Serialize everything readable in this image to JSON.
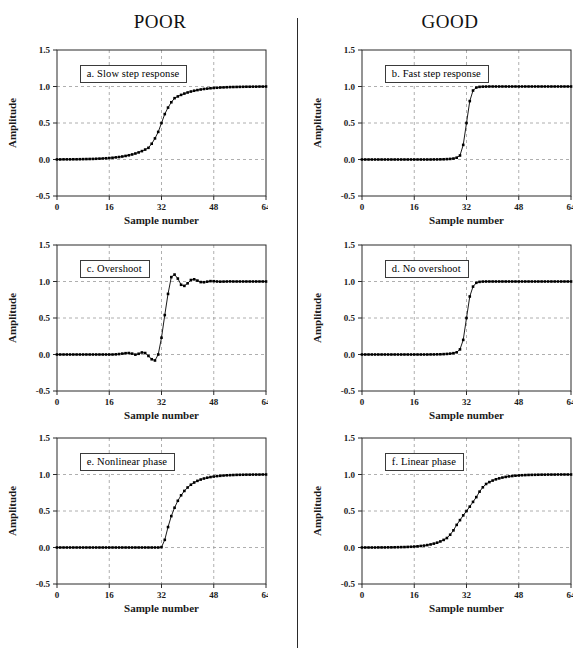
{
  "headings": {
    "left": "POOR",
    "right": "GOOD"
  },
  "axes": {
    "xlabel": "Sample number",
    "ylabel": "Amplitude",
    "xticks": [
      0,
      16,
      32,
      48,
      64
    ],
    "xtick_labels": [
      "0",
      "16",
      "32",
      "48",
      "64"
    ],
    "yticks": [
      -0.5,
      0.0,
      0.5,
      1.0,
      1.5
    ],
    "ytick_labels": [
      "-0.5",
      "0.0",
      "0.5",
      "1.0",
      "1.5"
    ],
    "xlim": [
      0,
      64
    ],
    "ylim": [
      -0.5,
      1.5
    ],
    "grid": true
  },
  "colors": {
    "ink": "#000000",
    "axis": "#2b2b2b",
    "grid": "#9a9a9a",
    "background": "#ffffff"
  },
  "chart_data": [
    {
      "id": "a",
      "type": "line",
      "column": "POOR",
      "title": "a.  Slow step response",
      "xlabel": "Sample number",
      "ylabel": "Amplitude",
      "xlim": [
        0,
        64
      ],
      "ylim": [
        -0.5,
        1.5
      ],
      "grid": true,
      "x": [
        0,
        1,
        2,
        3,
        4,
        5,
        6,
        7,
        8,
        9,
        10,
        11,
        12,
        13,
        14,
        15,
        16,
        17,
        18,
        19,
        20,
        21,
        22,
        23,
        24,
        25,
        26,
        27,
        28,
        29,
        30,
        31,
        32,
        33,
        34,
        35,
        36,
        37,
        38,
        39,
        40,
        41,
        42,
        43,
        44,
        45,
        46,
        47,
        48,
        49,
        50,
        51,
        52,
        53,
        54,
        55,
        56,
        57,
        58,
        59,
        60,
        61,
        62,
        63,
        64
      ],
      "values": [
        0.001,
        0.001,
        0.002,
        0.002,
        0.002,
        0.003,
        0.003,
        0.004,
        0.005,
        0.006,
        0.007,
        0.008,
        0.01,
        0.012,
        0.014,
        0.017,
        0.02,
        0.024,
        0.029,
        0.034,
        0.041,
        0.049,
        0.058,
        0.069,
        0.082,
        0.097,
        0.115,
        0.136,
        0.16,
        0.216,
        0.289,
        0.378,
        0.5,
        0.622,
        0.711,
        0.784,
        0.84,
        0.864,
        0.885,
        0.903,
        0.918,
        0.931,
        0.942,
        0.951,
        0.959,
        0.966,
        0.971,
        0.976,
        0.98,
        0.983,
        0.986,
        0.988,
        0.99,
        0.992,
        0.993,
        0.994,
        0.995,
        0.996,
        0.997,
        0.997,
        0.998,
        0.998,
        0.999,
        0.999,
        1.0
      ]
    },
    {
      "id": "b",
      "type": "line",
      "column": "GOOD",
      "title": "b.  Fast step response",
      "xlabel": "Sample number",
      "ylabel": "Amplitude",
      "xlim": [
        0,
        64
      ],
      "ylim": [
        -0.5,
        1.5
      ],
      "grid": true,
      "x": [
        0,
        1,
        2,
        3,
        4,
        5,
        6,
        7,
        8,
        9,
        10,
        11,
        12,
        13,
        14,
        15,
        16,
        17,
        18,
        19,
        20,
        21,
        22,
        23,
        24,
        25,
        26,
        27,
        28,
        29,
        30,
        31,
        32,
        33,
        34,
        35,
        36,
        37,
        38,
        39,
        40,
        41,
        42,
        43,
        44,
        45,
        46,
        47,
        48,
        49,
        50,
        51,
        52,
        53,
        54,
        55,
        56,
        57,
        58,
        59,
        60,
        61,
        62,
        63,
        64
      ],
      "values": [
        0.0,
        0.0,
        0.0,
        0.0,
        0.0,
        0.0,
        0.0,
        0.0,
        0.0,
        0.0,
        0.0,
        0.0,
        0.0,
        0.0,
        0.0,
        0.0,
        0.0,
        0.0,
        0.0,
        0.0,
        0.0,
        0.0,
        0.001,
        0.001,
        0.002,
        0.003,
        0.005,
        0.008,
        0.013,
        0.025,
        0.055,
        0.2,
        0.5,
        0.8,
        0.945,
        0.985,
        0.995,
        0.998,
        0.999,
        1.0,
        1.0,
        1.0,
        1.0,
        1.0,
        1.0,
        1.0,
        1.0,
        1.0,
        1.0,
        1.0,
        1.0,
        1.0,
        1.0,
        1.0,
        1.0,
        1.0,
        1.0,
        1.0,
        1.0,
        1.0,
        1.0,
        1.0,
        1.0,
        1.0,
        1.0
      ]
    },
    {
      "id": "c",
      "type": "line",
      "column": "POOR",
      "title": "c.  Overshoot",
      "xlabel": "Sample number",
      "ylabel": "Amplitude",
      "xlim": [
        0,
        64
      ],
      "ylim": [
        -0.5,
        1.5
      ],
      "grid": true,
      "x": [
        0,
        1,
        2,
        3,
        4,
        5,
        6,
        7,
        8,
        9,
        10,
        11,
        12,
        13,
        14,
        15,
        16,
        17,
        18,
        19,
        20,
        21,
        22,
        23,
        24,
        25,
        26,
        27,
        28,
        29,
        30,
        31,
        32,
        33,
        34,
        35,
        36,
        37,
        38,
        39,
        40,
        41,
        42,
        43,
        44,
        45,
        46,
        47,
        48,
        49,
        50,
        51,
        52,
        53,
        54,
        55,
        56,
        57,
        58,
        59,
        60,
        61,
        62,
        63,
        64
      ],
      "values": [
        0.0,
        0.0,
        0.0,
        0.0,
        0.0,
        0.0,
        0.0,
        0.0,
        0.0,
        0.0,
        0.0,
        0.0,
        0.0,
        0.0,
        0.0,
        0.0,
        0.0,
        0.0,
        0.002,
        0.006,
        0.012,
        0.018,
        0.02,
        0.012,
        -0.002,
        0.01,
        0.028,
        0.02,
        -0.02,
        -0.065,
        -0.082,
        0.0,
        0.23,
        0.54,
        0.83,
        1.06,
        1.095,
        1.04,
        0.955,
        0.94,
        0.975,
        1.02,
        1.03,
        1.012,
        0.992,
        0.99,
        0.998,
        1.005,
        1.004,
        1.0,
        0.998,
        0.999,
        1.0,
        1.001,
        1.0,
        1.0,
        1.0,
        1.0,
        1.0,
        1.0,
        1.0,
        1.0,
        1.0,
        1.0,
        1.0
      ]
    },
    {
      "id": "d",
      "type": "line",
      "column": "GOOD",
      "title": "d.  No overshoot",
      "xlabel": "Sample number",
      "ylabel": "Amplitude",
      "xlim": [
        0,
        64
      ],
      "ylim": [
        -0.5,
        1.5
      ],
      "grid": true,
      "x": [
        0,
        1,
        2,
        3,
        4,
        5,
        6,
        7,
        8,
        9,
        10,
        11,
        12,
        13,
        14,
        15,
        16,
        17,
        18,
        19,
        20,
        21,
        22,
        23,
        24,
        25,
        26,
        27,
        28,
        29,
        30,
        31,
        32,
        33,
        34,
        35,
        36,
        37,
        38,
        39,
        40,
        41,
        42,
        43,
        44,
        45,
        46,
        47,
        48,
        49,
        50,
        51,
        52,
        53,
        54,
        55,
        56,
        57,
        58,
        59,
        60,
        61,
        62,
        63,
        64
      ],
      "values": [
        0.0,
        0.0,
        0.0,
        0.0,
        0.0,
        0.0,
        0.0,
        0.0,
        0.0,
        0.0,
        0.0,
        0.0,
        0.0,
        0.0,
        0.0,
        0.0,
        0.0,
        0.0,
        0.0,
        0.0,
        0.0,
        0.001,
        0.001,
        0.002,
        0.003,
        0.005,
        0.008,
        0.012,
        0.018,
        0.03,
        0.07,
        0.2,
        0.5,
        0.795,
        0.93,
        0.982,
        0.995,
        0.999,
        1.0,
        1.0,
        1.0,
        1.0,
        1.0,
        1.0,
        1.0,
        1.0,
        1.0,
        1.0,
        1.0,
        1.0,
        1.0,
        1.0,
        1.0,
        1.0,
        1.0,
        1.0,
        1.0,
        1.0,
        1.0,
        1.0,
        1.0,
        1.0,
        1.0,
        1.0,
        1.0
      ]
    },
    {
      "id": "e",
      "type": "line",
      "column": "POOR",
      "title": "e.  Nonlinear phase",
      "xlabel": "Sample number",
      "ylabel": "Amplitude",
      "xlim": [
        0,
        64
      ],
      "ylim": [
        -0.5,
        1.5
      ],
      "grid": true,
      "x": [
        0,
        1,
        2,
        3,
        4,
        5,
        6,
        7,
        8,
        9,
        10,
        11,
        12,
        13,
        14,
        15,
        16,
        17,
        18,
        19,
        20,
        21,
        22,
        23,
        24,
        25,
        26,
        27,
        28,
        29,
        30,
        31,
        32,
        33,
        34,
        35,
        36,
        37,
        38,
        39,
        40,
        41,
        42,
        43,
        44,
        45,
        46,
        47,
        48,
        49,
        50,
        51,
        52,
        53,
        54,
        55,
        56,
        57,
        58,
        59,
        60,
        61,
        62,
        63,
        64
      ],
      "values": [
        0.0,
        0.0,
        0.0,
        0.0,
        0.0,
        0.0,
        0.0,
        0.0,
        0.0,
        0.0,
        0.0,
        0.0,
        0.0,
        0.0,
        0.0,
        0.0,
        0.0,
        0.0,
        0.0,
        0.0,
        0.0,
        0.0,
        0.0,
        0.0,
        0.0,
        0.0,
        0.0,
        0.0,
        0.0,
        0.0,
        0.0,
        0.0,
        0.005,
        0.105,
        0.28,
        0.43,
        0.545,
        0.64,
        0.715,
        0.775,
        0.822,
        0.86,
        0.89,
        0.913,
        0.931,
        0.945,
        0.956,
        0.965,
        0.972,
        0.978,
        0.982,
        0.986,
        0.989,
        0.991,
        0.993,
        0.995,
        0.996,
        0.997,
        0.998,
        0.998,
        0.999,
        0.999,
        0.999,
        1.0,
        1.0
      ]
    },
    {
      "id": "f",
      "type": "line",
      "column": "GOOD",
      "title": "f.  Linear phase",
      "xlabel": "Sample number",
      "ylabel": "Amplitude",
      "xlim": [
        0,
        64
      ],
      "ylim": [
        -0.5,
        1.5
      ],
      "grid": true,
      "x": [
        0,
        1,
        2,
        3,
        4,
        5,
        6,
        7,
        8,
        9,
        10,
        11,
        12,
        13,
        14,
        15,
        16,
        17,
        18,
        19,
        20,
        21,
        22,
        23,
        24,
        25,
        26,
        27,
        28,
        29,
        30,
        31,
        32,
        33,
        34,
        35,
        36,
        37,
        38,
        39,
        40,
        41,
        42,
        43,
        44,
        45,
        46,
        47,
        48,
        49,
        50,
        51,
        52,
        53,
        54,
        55,
        56,
        57,
        58,
        59,
        60,
        61,
        62,
        63,
        64
      ],
      "values": [
        0.0,
        0.0,
        0.0,
        0.0,
        0.0,
        0.001,
        0.001,
        0.001,
        0.002,
        0.002,
        0.003,
        0.004,
        0.005,
        0.006,
        0.008,
        0.01,
        0.013,
        0.016,
        0.021,
        0.026,
        0.033,
        0.042,
        0.053,
        0.066,
        0.083,
        0.104,
        0.13,
        0.175,
        0.235,
        0.31,
        0.375,
        0.44,
        0.5,
        0.56,
        0.625,
        0.69,
        0.765,
        0.825,
        0.87,
        0.896,
        0.917,
        0.934,
        0.947,
        0.958,
        0.967,
        0.974,
        0.979,
        0.984,
        0.987,
        0.99,
        0.992,
        0.994,
        0.995,
        0.996,
        0.997,
        0.998,
        0.998,
        0.999,
        0.999,
        0.999,
        1.0,
        1.0,
        1.0,
        1.0,
        1.0
      ]
    }
  ]
}
